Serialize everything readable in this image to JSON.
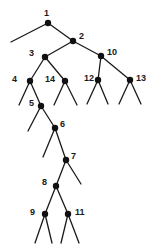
{
  "figure": {
    "name": "binary-tree-diagram",
    "type": "tree",
    "width": 153,
    "height": 252,
    "background_color": "#ffffff",
    "stroke_color": "#1a1a1a",
    "node_fill_color": "#111111",
    "node_radius": 3.2,
    "edge_width": 1.3
  },
  "chart_data": {
    "type": "diagram",
    "title": "",
    "node_count": 14,
    "labels": [
      "1",
      "2",
      "3",
      "4",
      "5",
      "6",
      "7",
      "8",
      "9",
      "10",
      "11",
      "12",
      "13",
      "14"
    ]
  },
  "nodes": [
    {
      "id": "n1",
      "label": "1",
      "x": 48,
      "y": 23,
      "lx": 44,
      "ly": 9
    },
    {
      "id": "n2",
      "label": "2",
      "x": 73,
      "y": 41,
      "lx": 79,
      "ly": 32
    },
    {
      "id": "n3",
      "label": "3",
      "x": 45,
      "y": 57,
      "lx": 29,
      "ly": 49
    },
    {
      "id": "n10",
      "label": "10",
      "x": 101,
      "y": 56,
      "lx": 107,
      "ly": 48
    },
    {
      "id": "n4",
      "label": "4",
      "x": 30,
      "y": 81,
      "lx": 12,
      "ly": 75
    },
    {
      "id": "n14",
      "label": "14",
      "x": 65,
      "y": 81,
      "lx": 45,
      "ly": 75
    },
    {
      "id": "n12",
      "label": "12",
      "x": 98,
      "y": 80,
      "lx": 84,
      "ly": 74
    },
    {
      "id": "n13",
      "label": "13",
      "x": 130,
      "y": 80,
      "lx": 136,
      "ly": 74
    },
    {
      "id": "n5",
      "label": "5",
      "x": 41,
      "y": 106,
      "lx": 29,
      "ly": 99
    },
    {
      "id": "n6",
      "label": "6",
      "x": 55,
      "y": 128,
      "lx": 60,
      "ly": 120
    },
    {
      "id": "n7",
      "label": "7",
      "x": 66,
      "y": 160,
      "lx": 71,
      "ly": 152
    },
    {
      "id": "n8",
      "label": "8",
      "x": 56,
      "y": 186,
      "lx": 42,
      "ly": 178
    },
    {
      "id": "n9",
      "label": "9",
      "x": 45,
      "y": 214,
      "lx": 30,
      "ly": 208
    },
    {
      "id": "n11",
      "label": "11",
      "x": 68,
      "y": 214,
      "lx": 75,
      "ly": 208
    }
  ],
  "edges": [
    {
      "from": "n1",
      "x1": 48,
      "y1": 23,
      "x2": 11,
      "y2": 42,
      "kind": "leaf-stub"
    },
    {
      "from": "n1",
      "x1": 48,
      "y1": 23,
      "x2": 73,
      "y2": 41,
      "kind": "branch"
    },
    {
      "from": "n2",
      "x1": 73,
      "y1": 41,
      "x2": 45,
      "y2": 57,
      "kind": "branch"
    },
    {
      "from": "n2",
      "x1": 73,
      "y1": 41,
      "x2": 101,
      "y2": 56,
      "kind": "branch"
    },
    {
      "from": "n3",
      "x1": 45,
      "y1": 57,
      "x2": 30,
      "y2": 81,
      "kind": "branch"
    },
    {
      "from": "n3",
      "x1": 45,
      "y1": 57,
      "x2": 65,
      "y2": 81,
      "kind": "branch"
    },
    {
      "from": "n10",
      "x1": 101,
      "y1": 56,
      "x2": 98,
      "y2": 80,
      "kind": "branch"
    },
    {
      "from": "n10",
      "x1": 101,
      "y1": 56,
      "x2": 130,
      "y2": 80,
      "kind": "branch"
    },
    {
      "from": "n4",
      "x1": 30,
      "y1": 81,
      "x2": 19,
      "y2": 105,
      "kind": "leaf-stub"
    },
    {
      "from": "n4",
      "x1": 30,
      "y1": 81,
      "x2": 41,
      "y2": 106,
      "kind": "branch"
    },
    {
      "from": "n14",
      "x1": 65,
      "y1": 81,
      "x2": 54,
      "y2": 105,
      "kind": "leaf-stub"
    },
    {
      "from": "n14",
      "x1": 65,
      "y1": 81,
      "x2": 77,
      "y2": 105,
      "kind": "leaf-stub"
    },
    {
      "from": "n12",
      "x1": 98,
      "y1": 80,
      "x2": 87,
      "y2": 104,
      "kind": "leaf-stub"
    },
    {
      "from": "n12",
      "x1": 98,
      "y1": 80,
      "x2": 108,
      "y2": 104,
      "kind": "leaf-stub"
    },
    {
      "from": "n13",
      "x1": 130,
      "y1": 80,
      "x2": 119,
      "y2": 104,
      "kind": "leaf-stub"
    },
    {
      "from": "n13",
      "x1": 130,
      "y1": 80,
      "x2": 141,
      "y2": 104,
      "kind": "leaf-stub"
    },
    {
      "from": "n5",
      "x1": 41,
      "y1": 106,
      "x2": 28,
      "y2": 131,
      "kind": "leaf-stub"
    },
    {
      "from": "n5",
      "x1": 41,
      "y1": 106,
      "x2": 55,
      "y2": 128,
      "kind": "branch"
    },
    {
      "from": "n6",
      "x1": 55,
      "y1": 128,
      "x2": 43,
      "y2": 157,
      "kind": "leaf-stub"
    },
    {
      "from": "n6",
      "x1": 55,
      "y1": 128,
      "x2": 66,
      "y2": 160,
      "kind": "branch"
    },
    {
      "from": "n7",
      "x1": 66,
      "y1": 160,
      "x2": 56,
      "y2": 186,
      "kind": "branch"
    },
    {
      "from": "n7",
      "x1": 66,
      "y1": 160,
      "x2": 81,
      "y2": 184,
      "kind": "leaf-stub"
    },
    {
      "from": "n8",
      "x1": 56,
      "y1": 186,
      "x2": 45,
      "y2": 214,
      "kind": "branch"
    },
    {
      "from": "n8",
      "x1": 56,
      "y1": 186,
      "x2": 68,
      "y2": 214,
      "kind": "branch"
    },
    {
      "from": "n9",
      "x1": 45,
      "y1": 214,
      "x2": 35,
      "y2": 243,
      "kind": "leaf-stub"
    },
    {
      "from": "n9",
      "x1": 45,
      "y1": 214,
      "x2": 52,
      "y2": 243,
      "kind": "leaf-stub"
    },
    {
      "from": "n11",
      "x1": 68,
      "y1": 214,
      "x2": 61,
      "y2": 243,
      "kind": "leaf-stub"
    },
    {
      "from": "n11",
      "x1": 68,
      "y1": 214,
      "x2": 79,
      "y2": 243,
      "kind": "leaf-stub"
    }
  ]
}
